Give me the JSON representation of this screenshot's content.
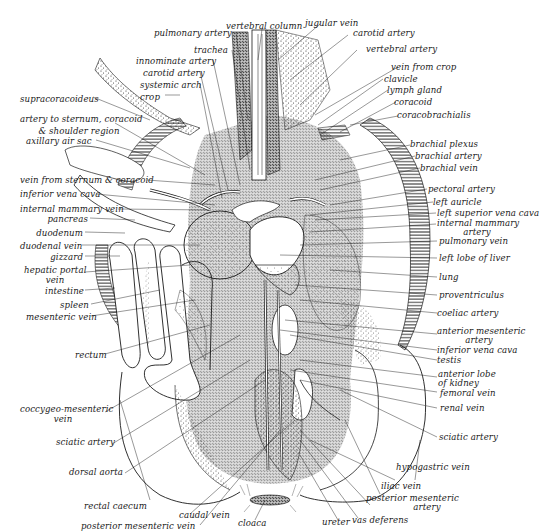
{
  "figure": {
    "colors": {
      "ink": "#1a1a1a",
      "background": "#ffffff",
      "stipple": "#333333"
    }
  },
  "labels": {
    "top": [
      {
        "id": "vertebral-column",
        "text": "vertebral column"
      },
      {
        "id": "jugular-vein",
        "text": "jugular vein"
      },
      {
        "id": "pulmonary-artery",
        "text": "pulmonary artery"
      },
      {
        "id": "carotid-artery-right",
        "text": "carotid artery"
      },
      {
        "id": "trachea",
        "text": "trachea"
      },
      {
        "id": "vertebral-artery",
        "text": "vertebral artery"
      },
      {
        "id": "innominate-artery",
        "text": "innominate artery"
      },
      {
        "id": "carotid-artery-left",
        "text": "carotid artery"
      },
      {
        "id": "systemic-arch",
        "text": "systemic arch"
      },
      {
        "id": "crop",
        "text": "crop"
      }
    ],
    "left": [
      {
        "id": "supracoracoideus",
        "text": "supracoracoideus"
      },
      {
        "id": "artery-to-sternum",
        "text": "artery to sternum, coracoid",
        "text2": "& shoulder region"
      },
      {
        "id": "axillary-air-sac",
        "text": "axillary air sac"
      },
      {
        "id": "vein-from-sternum",
        "text": "vein from sternum & coracoid"
      },
      {
        "id": "inferior-vena-cava-left",
        "text": "inferior vena cava"
      },
      {
        "id": "internal-mammary-vein",
        "text": "internal mammary vein"
      },
      {
        "id": "pancreas",
        "text": "pancreas"
      },
      {
        "id": "duodenum",
        "text": "duodenum"
      },
      {
        "id": "duodenal-vein",
        "text": "duodenal vein"
      },
      {
        "id": "gizzard",
        "text": "gizzard"
      },
      {
        "id": "hepatic-portal-vein",
        "text": "hepatic portal",
        "text2": "vein"
      },
      {
        "id": "intestine",
        "text": "intestine"
      },
      {
        "id": "spleen",
        "text": "spleen"
      },
      {
        "id": "mesenteric-vein",
        "text": "mesenteric vein"
      },
      {
        "id": "rectum",
        "text": "rectum"
      },
      {
        "id": "coccygeo-mesenteric-vein",
        "text": "coccygeo-mesenteric",
        "text2": "vein"
      },
      {
        "id": "sciatic-artery-left",
        "text": "sciatic artery"
      },
      {
        "id": "dorsal-aorta",
        "text": "dorsal aorta"
      },
      {
        "id": "rectal-caecum",
        "text": "rectal caecum"
      }
    ],
    "bottom": [
      {
        "id": "caudal-vein",
        "text": "caudal vein"
      },
      {
        "id": "posterior-mesenteric-vein",
        "text": "posterior mesenteric vein"
      },
      {
        "id": "cloaca",
        "text": "cloaca"
      },
      {
        "id": "ureter",
        "text": "ureter"
      },
      {
        "id": "vas-deferens",
        "text": "vas deferens"
      },
      {
        "id": "posterior-mesenteric-artery",
        "text": "posterior mesenteric",
        "text2": "artery"
      },
      {
        "id": "iliac-vein",
        "text": "iliac vein"
      },
      {
        "id": "hypogastric-vein",
        "text": "hypogastric vein"
      }
    ],
    "right": [
      {
        "id": "vein-from-crop",
        "text": "vein from crop"
      },
      {
        "id": "clavicle",
        "text": "clavicle"
      },
      {
        "id": "lymph-gland",
        "text": "lymph gland"
      },
      {
        "id": "coracoid",
        "text": "coracoid"
      },
      {
        "id": "coracobrachialis",
        "text": "coracobrachialis"
      },
      {
        "id": "brachial-plexus",
        "text": "brachial plexus"
      },
      {
        "id": "brachial-artery",
        "text": "brachial artery"
      },
      {
        "id": "brachial-vein",
        "text": "brachial vein"
      },
      {
        "id": "pectoral-artery",
        "text": "pectoral artery"
      },
      {
        "id": "left-auricle",
        "text": "left auricle"
      },
      {
        "id": "left-superior-vena-cava",
        "text": "left superior vena cava"
      },
      {
        "id": "internal-mammary-artery",
        "text": "internal mammary",
        "text2": "artery"
      },
      {
        "id": "pulmonary-vein",
        "text": "pulmonary vein"
      },
      {
        "id": "left-lobe-of-liver",
        "text": "left lobe of liver"
      },
      {
        "id": "lung",
        "text": "lung"
      },
      {
        "id": "proventriculus",
        "text": "proventriculus"
      },
      {
        "id": "coeliac-artery",
        "text": "coeliac artery"
      },
      {
        "id": "anterior-mesenteric-artery",
        "text": "anterior mesenteric",
        "text2": "artery"
      },
      {
        "id": "inferior-vena-cava-right",
        "text": "inferior vena cava"
      },
      {
        "id": "testis",
        "text": "testis"
      },
      {
        "id": "anterior-lobe-of-kidney",
        "text": "anterior lobe",
        "text2": "of kidney"
      },
      {
        "id": "femoral-vein",
        "text": "femoral vein"
      },
      {
        "id": "renal-vein",
        "text": "renal vein"
      },
      {
        "id": "sciatic-artery-right",
        "text": "sciatic artery"
      }
    ]
  }
}
